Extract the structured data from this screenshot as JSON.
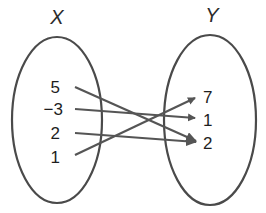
{
  "diagram": {
    "type": "mapping-diagram",
    "domain_set": {
      "label": "X",
      "elements": [
        "5",
        "−3",
        "2",
        "1"
      ]
    },
    "range_set": {
      "label": "Y",
      "elements": [
        "7",
        "1",
        "2"
      ]
    },
    "mappings": [
      {
        "from": "5",
        "to": "2"
      },
      {
        "from": "−3",
        "to": "1"
      },
      {
        "from": "2",
        "to": "2"
      },
      {
        "from": "1",
        "to": "7"
      }
    ],
    "colors": {
      "stroke": "#4a4a4a",
      "arrow": "#555555",
      "text": "#1e1e1e"
    }
  }
}
